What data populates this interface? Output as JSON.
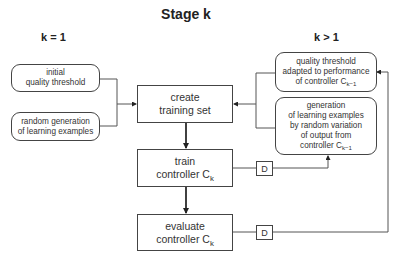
{
  "title": "Stage k",
  "columns": {
    "left_label": "k = 1",
    "right_label": "k > 1"
  },
  "left_inputs": [
    {
      "lines": [
        "initial",
        "quality threshold"
      ]
    },
    {
      "lines": [
        "random generation",
        "of learning examples"
      ]
    }
  ],
  "right_inputs": [
    {
      "lines": [
        "quality threshold",
        "adapted to performance",
        "of controller C"
      ],
      "subscript": "k−1"
    },
    {
      "lines": [
        "generation",
        "of learning examples",
        "by random variation",
        "of output from",
        "controller C"
      ],
      "subscript": "k−1"
    }
  ],
  "process": [
    {
      "lines": [
        "create",
        "training set"
      ]
    },
    {
      "lines": [
        "train",
        "controller C"
      ],
      "subscript": "k"
    },
    {
      "lines": [
        "evaluate",
        "controller C"
      ],
      "subscript": "k"
    }
  ],
  "delays": [
    {
      "label": "D"
    },
    {
      "label": "D"
    }
  ],
  "colors": {
    "stroke": "#444444",
    "text": "#333333",
    "background": "#ffffff"
  }
}
